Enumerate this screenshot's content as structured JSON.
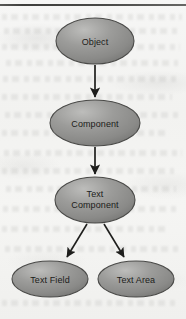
{
  "diagram": {
    "type": "inheritance-hierarchy",
    "colors": {
      "node_fill": "#8f8f8d",
      "node_fill_light": "#b4b4b2",
      "node_fill_dark": "#6e6e6c",
      "node_stroke": "#3a3a38",
      "arrow": "#1e1e1c",
      "paper": "#f4f4f2",
      "rule": "#2e2e2c"
    },
    "nodes": [
      {
        "id": "object",
        "label": "Object",
        "label_line1": "Object",
        "label_line2": "",
        "cx": 95,
        "cy": 41,
        "rx": 39,
        "ry": 23
      },
      {
        "id": "component",
        "label": "Component",
        "label_line1": "Component",
        "label_line2": "",
        "cx": 95,
        "cy": 123,
        "rx": 45,
        "ry": 23
      },
      {
        "id": "text-component",
        "label": "Text Component",
        "label_line1": "Text",
        "label_line2": "Component",
        "cx": 95,
        "cy": 200,
        "rx": 40,
        "ry": 23
      },
      {
        "id": "text-field",
        "label": "Text Field",
        "label_line1": "Text Field",
        "label_line2": "",
        "cx": 50,
        "cy": 279,
        "rx": 38,
        "ry": 18
      },
      {
        "id": "text-area",
        "label": "Text Area",
        "label_line1": "Text Area",
        "label_line2": "",
        "cx": 136,
        "cy": 279,
        "rx": 38,
        "ry": 18
      }
    ],
    "edges": [
      {
        "id": "object-to-component",
        "from": "object",
        "to": "component",
        "x1": 95,
        "y1": 65,
        "x2": 95,
        "y2": 98
      },
      {
        "id": "component-to-text-component",
        "from": "component",
        "to": "text-component",
        "x1": 95,
        "y1": 147,
        "x2": 95,
        "y2": 175
      },
      {
        "id": "text-component-to-text-field",
        "from": "text-component",
        "to": "text-field",
        "x1": 87,
        "y1": 224,
        "x2": 66,
        "y2": 258
      },
      {
        "id": "text-component-to-text-area",
        "from": "text-component",
        "to": "text-area",
        "x1": 104,
        "y1": 224,
        "x2": 124,
        "y2": 258
      }
    ]
  }
}
